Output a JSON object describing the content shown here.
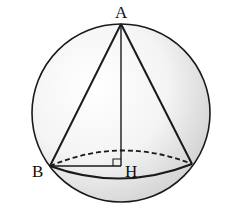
{
  "diagram": {
    "type": "cone inscribed in sphere",
    "labels": {
      "apex": "A",
      "base_point": "B",
      "base_center": "H"
    },
    "colors": {
      "stroke": "#1a1a1a",
      "shade": "#d9d9d9",
      "background": "#ffffff"
    }
  }
}
